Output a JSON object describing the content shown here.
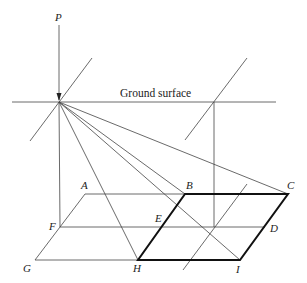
{
  "diagram": {
    "caption": "Ground surface",
    "points": {
      "P": {
        "label": "P",
        "x": 59,
        "y": 102
      },
      "A": {
        "label": "A",
        "x": 85,
        "y": 194
      },
      "B": {
        "label": "B",
        "x": 185,
        "y": 194
      },
      "C": {
        "label": "C",
        "x": 288,
        "y": 194
      },
      "F": {
        "label": "F",
        "x": 60,
        "y": 227
      },
      "E": {
        "label": "E",
        "x": 165,
        "y": 227
      },
      "D": {
        "label": "D",
        "x": 265,
        "y": 227
      },
      "G": {
        "label": "G",
        "x": 35,
        "y": 260
      },
      "H": {
        "label": "H",
        "x": 138,
        "y": 260
      },
      "I": {
        "label": "I",
        "x": 240,
        "y": 260
      }
    },
    "highlighted_parallelogram": [
      "B",
      "C",
      "I",
      "H"
    ]
  }
}
